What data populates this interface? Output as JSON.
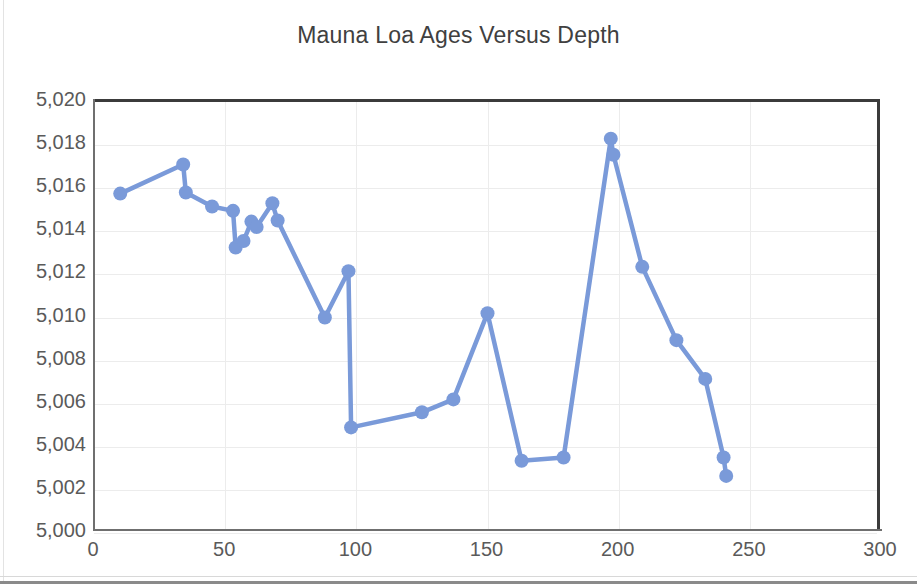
{
  "chart_data": {
    "type": "line",
    "title": "Mauna Loa Ages Versus Depth",
    "xlabel": "",
    "ylabel": "",
    "xlim": [
      0,
      300
    ],
    "ylim": [
      5000,
      5020
    ],
    "xticks": [
      "0",
      "50",
      "100",
      "150",
      "200",
      "250",
      "300"
    ],
    "xtick_values": [
      0,
      50,
      100,
      150,
      200,
      250,
      300
    ],
    "yticks": [
      "5,020",
      "5,018",
      "5,016",
      "5,014",
      "5,012",
      "5,010",
      "5,008",
      "5,006",
      "5,004",
      "5,002",
      "5,000"
    ],
    "ytick_values": [
      5020,
      5018,
      5016,
      5014,
      5012,
      5010,
      5008,
      5006,
      5004,
      5002,
      5000
    ],
    "grid": true,
    "legend": false,
    "marker": "circle",
    "series_color": "#7A9AD9",
    "x": [
      10,
      34,
      35,
      45,
      53,
      54,
      57,
      60,
      62,
      68,
      70,
      88,
      97,
      98,
      125,
      137,
      150,
      163,
      179,
      197,
      198,
      209,
      222,
      233,
      240,
      241
    ],
    "y": [
      5015.75,
      5017.1,
      5015.8,
      5015.15,
      5014.95,
      5013.25,
      5013.55,
      5014.45,
      5014.2,
      5015.3,
      5014.5,
      5010.0,
      5012.15,
      5004.9,
      5005.6,
      5006.2,
      5010.2,
      5003.35,
      5003.5,
      5018.3,
      5017.55,
      5012.35,
      5008.95,
      5007.15,
      5003.5,
      5002.65
    ],
    "points": [
      {
        "x": 10,
        "y": 5015.75
      },
      {
        "x": 34,
        "y": 5017.1
      },
      {
        "x": 35,
        "y": 5015.8
      },
      {
        "x": 45,
        "y": 5015.15
      },
      {
        "x": 53,
        "y": 5014.95
      },
      {
        "x": 54,
        "y": 5013.25
      },
      {
        "x": 57,
        "y": 5013.55
      },
      {
        "x": 60,
        "y": 5014.45
      },
      {
        "x": 62,
        "y": 5014.2
      },
      {
        "x": 68,
        "y": 5015.3
      },
      {
        "x": 70,
        "y": 5014.5
      },
      {
        "x": 88,
        "y": 5010.0
      },
      {
        "x": 97,
        "y": 5012.15
      },
      {
        "x": 98,
        "y": 5004.9
      },
      {
        "x": 125,
        "y": 5005.6
      },
      {
        "x": 137,
        "y": 5006.2
      },
      {
        "x": 150,
        "y": 5010.2
      },
      {
        "x": 163,
        "y": 5003.35
      },
      {
        "x": 179,
        "y": 5003.5
      },
      {
        "x": 197,
        "y": 5018.3
      },
      {
        "x": 198,
        "y": 5017.55
      },
      {
        "x": 209,
        "y": 5012.35
      },
      {
        "x": 222,
        "y": 5008.95
      },
      {
        "x": 233,
        "y": 5007.15
      },
      {
        "x": 240,
        "y": 5003.5
      },
      {
        "x": 241,
        "y": 5002.65
      }
    ]
  },
  "colors": {
    "series": "#7A9AD9",
    "axis": "#6f6f6f",
    "frame": "#3b3b3b",
    "grid": "#ececec",
    "tick_text": "#5a5a5a",
    "title_text": "#404040"
  }
}
